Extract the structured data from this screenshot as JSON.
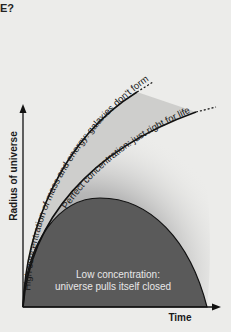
{
  "page": {
    "top_fragment": "E?"
  },
  "diagram": {
    "axes": {
      "y_label": "Radius of universe",
      "x_label": "Time"
    },
    "curves": [
      {
        "id": "high",
        "label": "High concentration of mass and energy: galaxies don't form",
        "fate": "expands rapidly",
        "continues": true
      },
      {
        "id": "perfect",
        "label": "Perfect concentration: just right for life",
        "fate": "expands steadily",
        "continues": true
      },
      {
        "id": "low",
        "label_line1": "Low concentration:",
        "label_line2": "universe pulls itself closed",
        "fate": "recollapses",
        "continues": false
      }
    ],
    "colors": {
      "background": "#ececea",
      "closed_fill": "#5a5a5a",
      "band_fill": "#b4b4b4",
      "line": "#111111",
      "inner_text": "#e8e8e8"
    }
  }
}
